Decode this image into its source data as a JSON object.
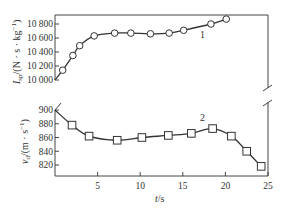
{
  "chart_data": [
    {
      "id": "upper",
      "type": "line",
      "series": [
        {
          "name": "1",
          "marker": "circle",
          "x": [
            0.9,
            2.1,
            2.9,
            4.6,
            7.0,
            8.9,
            11.2,
            13.4,
            15.1,
            18.3,
            20.1
          ],
          "values": [
            10140,
            10350,
            10490,
            10630,
            10670,
            10670,
            10660,
            10670,
            10710,
            10800,
            10870
          ],
          "curve_start": {
            "x": 0,
            "y": 10000
          }
        }
      ],
      "xlim": [
        0,
        25
      ],
      "ylim": [
        10000,
        10900
      ],
      "yticks": [
        10000,
        10200,
        10400,
        10600,
        10800
      ],
      "ytick_labels": [
        "10 000",
        "10 200",
        "10 400",
        "10 600",
        "10 800"
      ],
      "ylabel_main": "I",
      "ylabel_sub": "sp",
      "ylabel_rest": "/(N · s · kg",
      "ylabel_sup": "−1",
      "ylabel_close": ")",
      "series_label": "1"
    },
    {
      "id": "lower",
      "type": "line",
      "series": [
        {
          "name": "2",
          "marker": "square",
          "x": [
            2.0,
            4.0,
            7.3,
            10.2,
            13.3,
            16.0,
            18.5,
            20.7,
            22.5,
            24.2
          ],
          "values": [
            878,
            862,
            856,
            860,
            863,
            866,
            873,
            862,
            840,
            818
          ],
          "curve_start": {
            "x": 0,
            "y": 900
          }
        }
      ],
      "xlim": [
        0,
        25
      ],
      "ylim": [
        805,
        900
      ],
      "yticks": [
        820,
        840,
        860,
        880,
        900
      ],
      "ytick_labels": [
        "820",
        "840",
        "860",
        "880",
        "900"
      ],
      "xticks": [
        5,
        10,
        15,
        20,
        25
      ],
      "xtick_labels": [
        "5",
        "10",
        "15",
        "20",
        "25"
      ],
      "ylabel_main": "v",
      "ylabel_sub": "d",
      "ylabel_rest": "/(m · s",
      "ylabel_sup": "−1",
      "ylabel_close": ")",
      "xlabel_main": "t",
      "xlabel_rest": "/s",
      "series_label": "2"
    }
  ],
  "colors": {
    "line": "#333333",
    "axis": "#444444",
    "marker_fill": "#ffffff"
  }
}
